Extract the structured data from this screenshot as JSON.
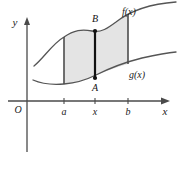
{
  "figure": {
    "background_color": "#ffffff",
    "width": 179,
    "height": 178
  },
  "axes": {
    "y_axis_label": "y",
    "x_axis_label": "x",
    "origin_label": "O",
    "axis_color": "#4a4a4a",
    "x_axis_y": 101,
    "y_axis_x": 27
  },
  "ticks": [
    {
      "label": "a",
      "x": 64
    },
    {
      "label": "x",
      "x": 95
    },
    {
      "label": "b",
      "x": 128
    }
  ],
  "curves": [
    {
      "name": "f(x)",
      "label": "f(x)",
      "label_x": 122,
      "label_y": 15,
      "color": "#555555",
      "path": "M 34,66 C 44,58 52,44 64,37 C 74,30 82,29 92,31 C 101,33 108,28 116,22 C 130,11 148,4 176,2"
    },
    {
      "name": "g(x)",
      "label": "g(x)",
      "label_x": 129,
      "label_y": 78,
      "color": "#555555",
      "path": "M 33,80 C 42,84 52,85 64,84 C 76,83 86,80 96,75 C 110,68 126,62 142,58 C 156,55 166,53 176,52"
    }
  ],
  "shaded_region": {
    "name": "area-between-curves",
    "fill_color": "#e4e4e4",
    "stroke_color": "#6b6b6b",
    "left_bound": "a",
    "right_bound": "b",
    "path": "M 64,37 C 74,30 82,29 92,31 C 101,33 108,28 116,22 L 128,14 L 128,64 C 120,66 112,69 104,72 C 94,76 84,80 74,83 C 70,84 67,84 64,84 Z"
  },
  "boundary_lines": [
    {
      "name": "left-boundary-a",
      "x": 64,
      "y1": 37,
      "y2": 84,
      "color": "#4d4d4d"
    },
    {
      "name": "right-boundary-b",
      "x": 128,
      "y1": 14,
      "y2": 64,
      "color": "#4d4d4d"
    }
  ],
  "segment": {
    "name": "segment-AB",
    "x": 95,
    "top_label": "B",
    "bottom_label": "A",
    "top_y": 31,
    "bottom_y": 78,
    "top_label_y": 22,
    "bottom_label_y": 91,
    "color": "#111111"
  }
}
